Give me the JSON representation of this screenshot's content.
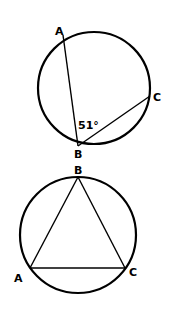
{
  "figure1": {
    "description": "Inscribed angle ABC in a circle",
    "points": {
      "A": {
        "label": "A",
        "x": 62,
        "y": 37
      },
      "B": {
        "label": "B",
        "x": 78,
        "y": 146
      },
      "C": {
        "label": "C",
        "x": 150,
        "y": 96
      }
    },
    "circle": {
      "cx": 94,
      "cy": 88,
      "r": 56
    },
    "angle_label": "51°",
    "angle_vertex": "B"
  },
  "figure2": {
    "description": "Triangle ABC inscribed in a circle",
    "points": {
      "A": {
        "label": "A",
        "x": 30,
        "y": 268
      },
      "B": {
        "label": "B",
        "x": 78,
        "y": 178
      },
      "C": {
        "label": "C",
        "x": 125,
        "y": 268
      }
    },
    "circle": {
      "cx": 78,
      "cy": 235,
      "r": 58
    }
  },
  "colors": {
    "stroke": "#000000",
    "background": "#ffffff"
  }
}
